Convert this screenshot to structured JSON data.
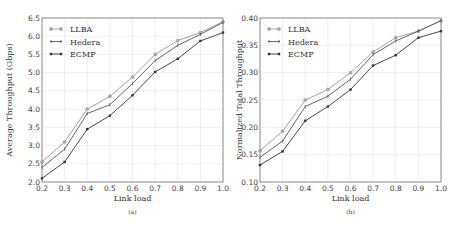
{
  "chart_data": [
    {
      "id": "a",
      "type": "line",
      "title": "",
      "caption": "(a)",
      "xlabel": "Link load",
      "ylabel": "Average Throughput (Gbps)",
      "x": [
        0.2,
        0.3,
        0.4,
        0.5,
        0.6,
        0.7,
        0.8,
        0.9,
        1.0
      ],
      "xlim": [
        0.2,
        1.0
      ],
      "ylim": [
        2.0,
        6.5
      ],
      "xticks": [
        "0.2",
        "0.3",
        "0.4",
        "0.5",
        "0.6",
        "0.7",
        "0.8",
        "0.9",
        "1.0"
      ],
      "yticks": [
        "2.0",
        "2.5",
        "3.0",
        "3.5",
        "4.0",
        "4.5",
        "5.0",
        "5.5",
        "6.0",
        "6.5"
      ],
      "grid": true,
      "legend_position": "upper left",
      "series": [
        {
          "name": "LLBA",
          "color": "#999999",
          "marker": "circle",
          "values": [
            2.55,
            3.1,
            4.0,
            4.35,
            4.88,
            5.5,
            5.88,
            6.1,
            6.4
          ]
        },
        {
          "name": "Hedera",
          "color": "#555555",
          "marker": "tick",
          "values": [
            2.4,
            2.9,
            3.88,
            4.12,
            4.7,
            5.33,
            5.75,
            6.05,
            6.38
          ]
        },
        {
          "name": "ECMP",
          "color": "#333333",
          "marker": "square",
          "values": [
            2.1,
            2.55,
            3.45,
            3.82,
            4.38,
            5.02,
            5.38,
            5.87,
            6.1
          ]
        }
      ]
    },
    {
      "id": "b",
      "type": "line",
      "title": "",
      "caption": "(b)",
      "xlabel": "Link load",
      "ylabel": "Normalized Total Throughput",
      "x": [
        0.2,
        0.3,
        0.4,
        0.5,
        0.6,
        0.7,
        0.8,
        0.9,
        1.0
      ],
      "xlim": [
        0.2,
        1.0
      ],
      "ylim": [
        0.1,
        0.4
      ],
      "xticks": [
        "0.2",
        "0.3",
        "0.4",
        "0.5",
        "0.6",
        "0.7",
        "0.8",
        "0.9",
        "1.0"
      ],
      "yticks": [
        "0.10",
        "0.15",
        "0.20",
        "0.25",
        "0.30",
        "0.35",
        "0.40"
      ],
      "grid": true,
      "legend_position": "upper left",
      "series": [
        {
          "name": "LLBA",
          "color": "#999999",
          "marker": "circle",
          "values": [
            0.157,
            0.193,
            0.25,
            0.269,
            0.3,
            0.338,
            0.364,
            0.376,
            0.395
          ]
        },
        {
          "name": "Hedera",
          "color": "#555555",
          "marker": "tick",
          "values": [
            0.145,
            0.175,
            0.238,
            0.257,
            0.288,
            0.333,
            0.358,
            0.376,
            0.395
          ]
        },
        {
          "name": "ECMP",
          "color": "#333333",
          "marker": "square",
          "values": [
            0.131,
            0.156,
            0.212,
            0.238,
            0.269,
            0.313,
            0.332,
            0.364,
            0.376
          ]
        }
      ]
    }
  ]
}
